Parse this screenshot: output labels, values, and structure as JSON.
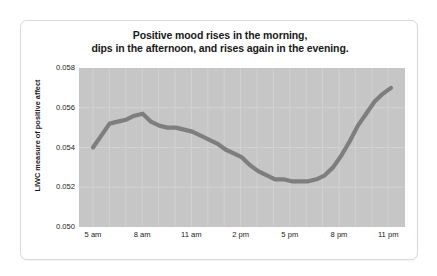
{
  "chart_data": {
    "type": "line",
    "title": "Positive mood rises in the morning, dips in the afternoon, and rises again in the evening.",
    "title_lines": [
      "Positive mood rises in the morning,",
      "dips in the afternoon, and rises again in the evening."
    ],
    "xlabel": "",
    "ylabel": "LIWC measure of positive affect",
    "ylim": [
      0.05,
      0.058
    ],
    "y_ticks": [
      0.058,
      0.056,
      0.054,
      0.052,
      0.05
    ],
    "y_tick_labels": [
      "0.058",
      "0.056",
      "0.054",
      "0.052",
      "0.050"
    ],
    "x_ticks": [
      5,
      8,
      11,
      14,
      17,
      20,
      23
    ],
    "x_tick_labels": [
      "5 am",
      "8 am",
      "11 am",
      "2 pm",
      "5 pm",
      "8 pm",
      "11 pm"
    ],
    "xlim": [
      5,
      23
    ],
    "grid": true,
    "legend": "none",
    "plot_background_color": "#c6c6c6",
    "line_color": "#7e7e7e",
    "grid_color": "#d5d5d5",
    "series": [
      {
        "name": "LIWC measure of positive affect",
        "x": [
          5,
          5.5,
          6,
          6.5,
          7,
          7.5,
          8,
          8.5,
          9,
          9.5,
          10,
          10.5,
          11,
          11.5,
          12,
          12.5,
          13,
          13.5,
          14,
          14.5,
          15,
          15.5,
          16,
          16.5,
          17,
          17.5,
          18,
          18.5,
          19,
          19.5,
          20,
          20.5,
          21,
          21.5,
          22,
          22.5,
          23
        ],
        "values": [
          0.054,
          0.0546,
          0.0552,
          0.0553,
          0.0554,
          0.0556,
          0.0557,
          0.0553,
          0.0551,
          0.055,
          0.055,
          0.0549,
          0.0548,
          0.0546,
          0.0544,
          0.0542,
          0.0539,
          0.0537,
          0.0535,
          0.0531,
          0.0528,
          0.0526,
          0.0524,
          0.0524,
          0.0523,
          0.0523,
          0.0523,
          0.0524,
          0.0526,
          0.053,
          0.0536,
          0.0543,
          0.0551,
          0.0557,
          0.0563,
          0.0567,
          0.057
        ]
      }
    ]
  }
}
